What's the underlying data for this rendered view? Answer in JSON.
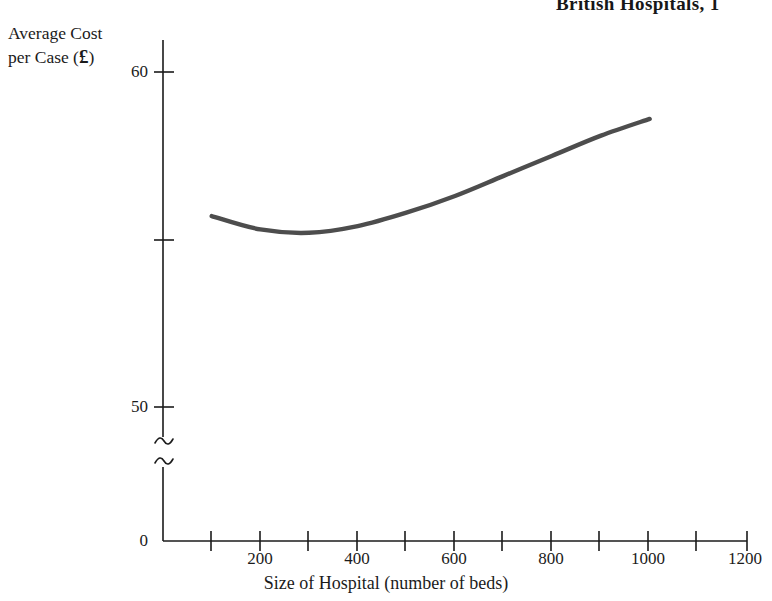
{
  "chart_data": {
    "type": "line",
    "title": "British Hospitals, 1",
    "title_note": "title is cropped at the top and right edge of the image",
    "xlabel": "Size of Hospital (number of beds)",
    "ylabel": "Average Cost per Case (£)",
    "ylabel_line1": "Average Cost",
    "ylabel_line2_prefix": "per Case (",
    "ylabel_currency": "£",
    "ylabel_line2_suffix": ")",
    "grid": false,
    "legend": false,
    "legend_position": "none",
    "xlim": [
      0,
      1200
    ],
    "ylim": [
      50,
      60
    ],
    "y_axis_break": true,
    "y_axis_break_note": "axis broken between 0 and 50 (double squiggle)",
    "x_ticks": [
      0,
      100,
      200,
      300,
      400,
      500,
      600,
      700,
      800,
      900,
      1000,
      1100,
      1200
    ],
    "x_tick_labels": [
      "0",
      "",
      "200",
      "",
      "400",
      "",
      "600",
      "",
      "800",
      "",
      "1000",
      "",
      "1200"
    ],
    "y_ticks": [
      0,
      50,
      55,
      60
    ],
    "y_tick_labels": [
      "0",
      "50",
      "",
      "60"
    ],
    "series": [
      {
        "name": "Average cost per case",
        "color": "#4d4d4d",
        "x": [
          100,
          200,
          300,
          400,
          500,
          600,
          700,
          800,
          900,
          1000
        ],
        "values": [
          55.7,
          55.3,
          55.2,
          55.4,
          55.8,
          56.3,
          56.9,
          57.5,
          58.1,
          58.6
        ]
      }
    ]
  },
  "axes": {
    "x_tick_labels": [
      {
        "value": 0,
        "text": "0"
      },
      {
        "value": 200,
        "text": "200"
      },
      {
        "value": 400,
        "text": "400"
      },
      {
        "value": 600,
        "text": "600"
      },
      {
        "value": 800,
        "text": "800"
      },
      {
        "value": 1000,
        "text": "1000"
      },
      {
        "value": 1200,
        "text": "1200"
      }
    ],
    "y_tick_labels": [
      {
        "value": 60,
        "text": "60"
      },
      {
        "value": 50,
        "text": "50"
      },
      {
        "value": 0,
        "text": "0"
      }
    ]
  },
  "labels": {
    "y_tick_60": "60",
    "y_tick_50": "50",
    "y_tick_0": "0",
    "x_tick_200": "200",
    "x_tick_400": "400",
    "x_tick_600": "600",
    "x_tick_800": "800",
    "x_tick_1000": "1000",
    "x_tick_1200": "1200"
  },
  "colors": {
    "curve": "#4d4d4d",
    "axis": "#1b1b1b",
    "text": "#1b1b1b",
    "background": "#ffffff"
  }
}
